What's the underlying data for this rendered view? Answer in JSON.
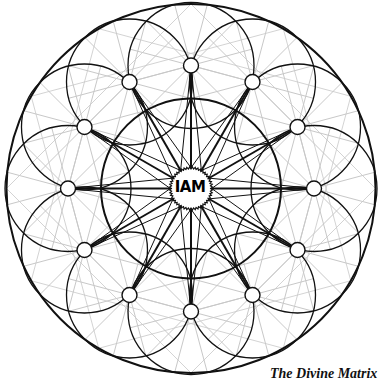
{
  "diagram": {
    "title": "The Divine Matrix",
    "center_label": "IAM",
    "geometry": {
      "center": [
        191,
        188.5
      ],
      "outer_radius": 184.5,
      "inner_radius": 90,
      "node_ring_radius": 123,
      "node_count": 12,
      "node_radius": 7.5,
      "node_circle_radius": 63,
      "medallion_radius": 20
    },
    "colors": {
      "ink": "#111111",
      "gray_lines": "#c8c8c8",
      "background": "#ffffff"
    }
  }
}
